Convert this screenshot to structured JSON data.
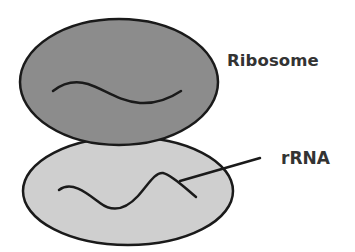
{
  "diagram": {
    "labels": {
      "ribosome": "Ribosome",
      "rrna": "rRNA"
    },
    "colors": {
      "background": "#ffffff",
      "large_subunit_fill": "#8c8c8c",
      "small_subunit_fill": "#cfcfcf",
      "outline": "#1a1a1a",
      "label_text": "#333333"
    },
    "shapes": {
      "small_subunit": {
        "cx": 128,
        "cy": 191,
        "rx": 105,
        "ry": 54
      },
      "large_subunit": {
        "cx": 119,
        "cy": 82,
        "rx": 99,
        "ry": 63
      }
    }
  }
}
